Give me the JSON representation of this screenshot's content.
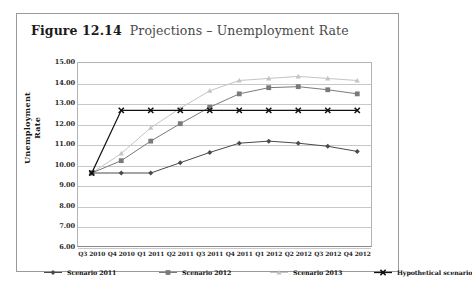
{
  "figure": {
    "number": "Figure 12.14",
    "caption": "Projections – Unemployment Rate"
  },
  "chart_data": {
    "type": "line",
    "title": "Projections – Unemployment Rate",
    "xlabel": "",
    "ylabel": "Unemployment Rate",
    "ylim": [
      6.0,
      15.0
    ],
    "ytick_step": 1.0,
    "grid": true,
    "legend_position": "bottom",
    "ytick_labels": [
      "15.00",
      "14.00",
      "13.00",
      "12.00",
      "11.00",
      "10.00",
      "9.00",
      "8.00",
      "7.00",
      "6.00"
    ],
    "ytick_values": [
      15,
      14,
      13,
      12,
      11,
      10,
      9,
      8,
      7,
      6
    ],
    "categories": [
      "Q3 2010",
      "Q4 2010",
      "Q1 2011",
      "Q2 2011",
      "Q3 2011",
      "Q4 2011",
      "Q1 2012",
      "Q2 2012",
      "Q3 2012",
      "Q4 2012"
    ],
    "series": [
      {
        "name": "Scenario 2011",
        "color": "#4a4a4a",
        "marker": "diamond",
        "values": [
          9.6,
          9.6,
          9.6,
          10.1,
          10.6,
          11.05,
          11.15,
          11.05,
          10.9,
          10.65
        ]
      },
      {
        "name": "Scenario 2012",
        "color": "#7a7a7a",
        "marker": "square",
        "values": [
          9.6,
          10.2,
          11.15,
          12.0,
          12.8,
          13.45,
          13.75,
          13.8,
          13.65,
          13.45
        ]
      },
      {
        "name": "Scenario 2013",
        "color": "#c4c4c4",
        "marker": "triangle",
        "values": [
          9.6,
          10.55,
          11.8,
          12.75,
          13.6,
          14.1,
          14.2,
          14.3,
          14.2,
          14.1
        ]
      },
      {
        "name": "Hypothetical scenario",
        "color": "#111111",
        "marker": "cross",
        "values": [
          9.6,
          12.65,
          12.65,
          12.65,
          12.65,
          12.65,
          12.65,
          12.65,
          12.65,
          12.65
        ]
      }
    ]
  },
  "legend": {
    "items": [
      {
        "label": "Scenario 2011",
        "color": "#4a4a4a",
        "marker": "diamond"
      },
      {
        "label": "Scenario 2012",
        "color": "#7a7a7a",
        "marker": "square"
      },
      {
        "label": "Scenario 2013",
        "color": "#c4c4c4",
        "marker": "triangle"
      },
      {
        "label": "Hypothetical scenario",
        "color": "#111111",
        "marker": "cross"
      }
    ]
  }
}
